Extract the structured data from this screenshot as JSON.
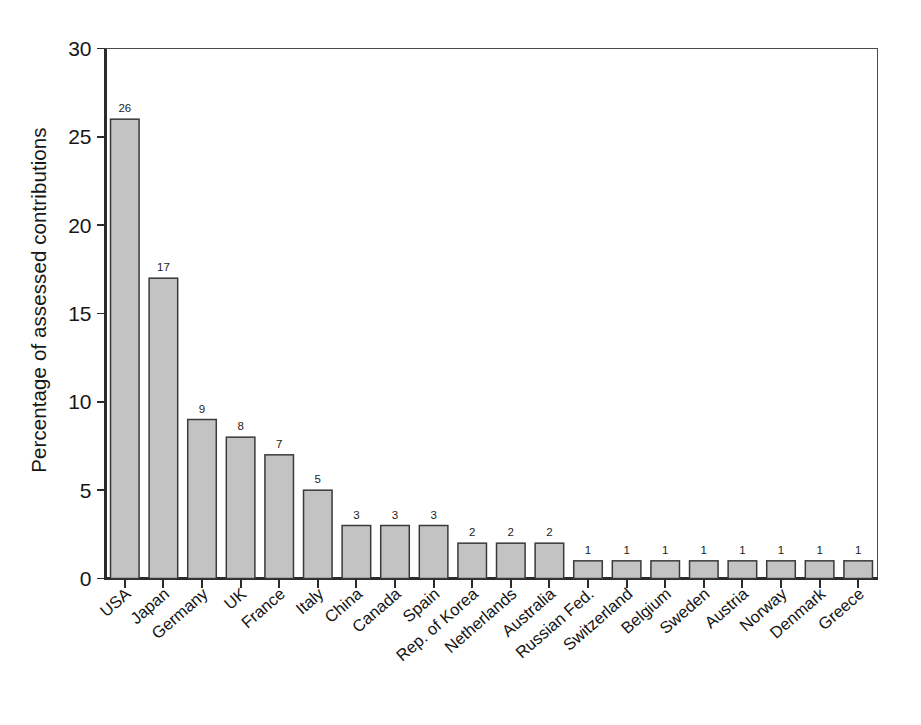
{
  "chart_data": {
    "type": "bar",
    "title": "",
    "xlabel": "",
    "ylabel": "Percentage of assessed contributions",
    "ylim": [
      0,
      30
    ],
    "yticks": [
      0,
      5,
      10,
      15,
      20,
      25,
      30
    ],
    "ytick_labels": [
      "0",
      "5",
      "10",
      "15",
      "20",
      "25",
      "30"
    ],
    "grid": false,
    "legend": false,
    "bar_fill_color": "#c3c3c3",
    "bar_edge_color": "#3a3a3a",
    "background_color": "#ffffff",
    "categories": [
      "USA",
      "Japan",
      "Germany",
      "UK",
      "France",
      "Italy",
      "China",
      "Canada",
      "Spain",
      "Rep. of Korea",
      "Netherlands",
      "Australia",
      "Russian Fed.",
      "Switzerland",
      "Belgium",
      "Sweden",
      "Austria",
      "Norway",
      "Denmark",
      "Greece"
    ],
    "values": [
      26,
      17,
      9,
      8,
      7,
      5,
      3,
      3,
      3,
      2,
      2,
      2,
      1,
      1,
      1,
      1,
      1,
      1,
      1,
      1
    ],
    "value_labels": [
      "26",
      "17",
      "9",
      "8",
      "7",
      "5",
      "3",
      "3",
      "3",
      "2",
      "2",
      "2",
      "1",
      "1",
      "1",
      "1",
      "1",
      "1",
      "1",
      "1"
    ]
  }
}
